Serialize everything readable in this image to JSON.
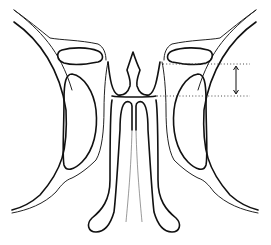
{
  "diagram": {
    "type": "anatomical line drawing",
    "labels": [],
    "annotations": {
      "measurement": {
        "description": "vertical double-headed arrow between two dotted horizontal reference lines on right side",
        "upper_line_y": 64,
        "lower_line_y": 96
      }
    },
    "colors": {
      "background": "#ffffff",
      "line": "#111111",
      "dotted": "#333333"
    }
  }
}
